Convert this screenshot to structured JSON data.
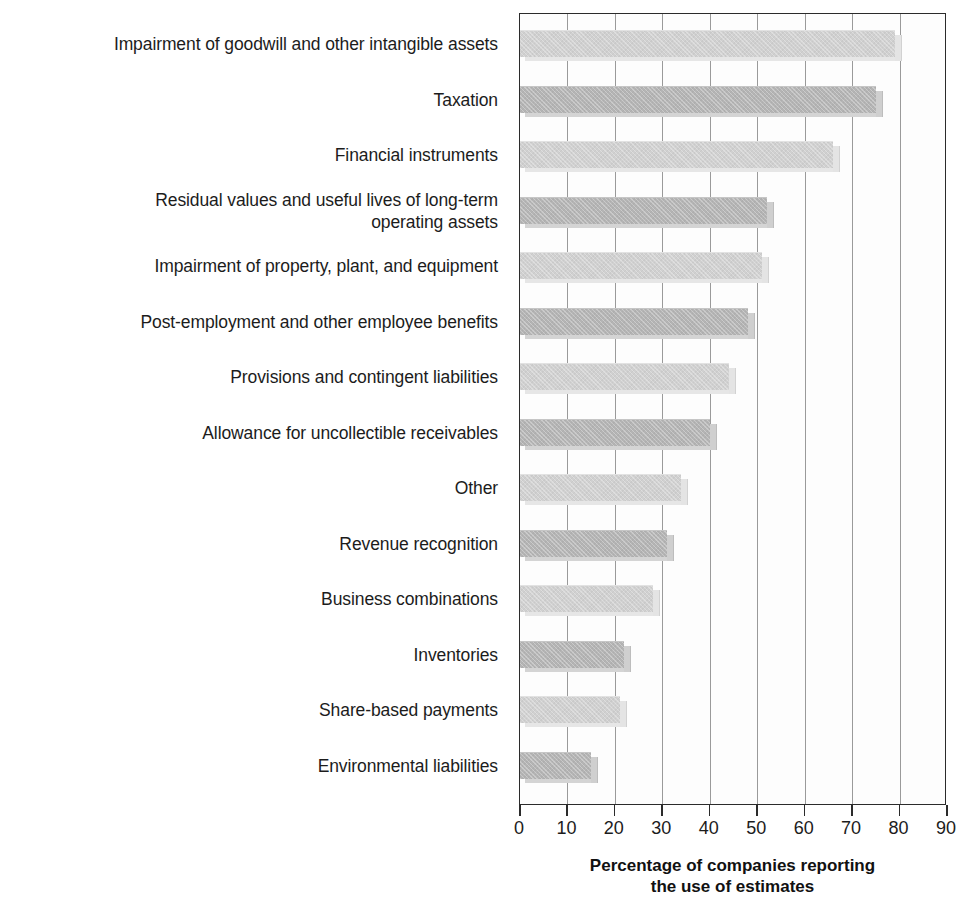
{
  "chart_data": {
    "type": "bar",
    "orientation": "horizontal",
    "title": "",
    "xlabel": "Percentage of companies reporting\nthe use of estimates",
    "ylabel": "",
    "xlim": [
      0,
      90
    ],
    "xticks": [
      0,
      10,
      20,
      30,
      40,
      50,
      60,
      70,
      80,
      90
    ],
    "grid": true,
    "legend": "none",
    "categories": [
      "Impairment of goodwill and other intangible assets",
      "Taxation",
      "Financial instruments",
      "Residual values and useful lives of long-term\noperating assets",
      "Impairment of property, plant, and equipment",
      "Post-employment and other employee benefits",
      "Provisions and contingent liabilities",
      "Allowance for uncollectible receivables",
      "Other",
      "Revenue recognition",
      "Business combinations",
      "Inventories",
      "Share-based payments",
      "Environmental liabilities"
    ],
    "values": [
      79,
      75,
      66,
      52,
      51,
      48,
      44,
      40,
      34,
      31,
      28,
      22,
      21,
      15
    ],
    "bar_shades": [
      "light",
      "dark",
      "light",
      "dark",
      "light",
      "dark",
      "light",
      "dark",
      "light",
      "dark",
      "light",
      "dark",
      "light",
      "dark"
    ]
  },
  "colors": {
    "bar_light": "#d0d0d0",
    "bar_dark": "#b4b4b4",
    "axis": "#2b2b2b",
    "gridline": "#9a9a9a",
    "text": "#1c1c1c",
    "background": "#ffffff"
  },
  "axis": {
    "title_line1": "Percentage of companies reporting",
    "title_line2": "the use of estimates"
  }
}
